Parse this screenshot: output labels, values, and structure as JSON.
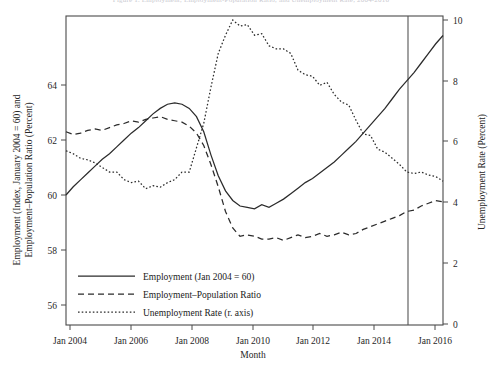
{
  "figure": {
    "cut_off_title": "Figure 1. Employment, Employment-Population Ratio, and Unemployment Rate, 2004-2016"
  },
  "axes": {
    "x_title": "Month",
    "y_left_title_line1": "Employment (Index, January 2004 = 60) and",
    "y_left_title_line2": "Employment–Population Ratio (Percent)",
    "y_right_title": "Unemployment Rate (Percent)",
    "x_ticks": [
      "Jan 2004",
      "Jan 2006",
      "Jan 2008",
      "Jan 2010",
      "Jan 2012",
      "Jan 2014",
      "Jan 2016"
    ],
    "y_left_ticks": [
      "56",
      "58",
      "60",
      "62",
      "64"
    ],
    "y_right_ticks": [
      "0",
      "2",
      "4",
      "6",
      "8",
      "10"
    ]
  },
  "legend": {
    "items": [
      {
        "label": "Employment (Jan 2004 = 60)",
        "style": "solid"
      },
      {
        "label": "Employment–Population Ratio",
        "style": "dashed"
      },
      {
        "label": "Unemployment Rate (r. axis)",
        "style": "dotted"
      }
    ]
  },
  "annotations": {
    "vertical_line_label": "Jan 2015"
  },
  "colors": {
    "line": "#2b2b2b",
    "frame": "#4a4a4a",
    "vline": "#555555",
    "background": "#ffffff"
  },
  "chart_data": {
    "type": "line",
    "title": "Employment, Employment-Population Ratio, and Unemployment Rate",
    "xlabel": "Month",
    "ylabel": "Employment (Index, January 2004 = 60) and Employment-Population Ratio (Percent)",
    "ylabel_right": "Unemployment Rate (Percent)",
    "ylim": [
      55.6,
      66.0
    ],
    "ylim_right": [
      0,
      10.5
    ],
    "xlim": [
      "Jan 2004",
      "Dec 2016"
    ],
    "grid": false,
    "legend_position": "lower left",
    "vertical_reference_line": "Jan 2015",
    "x": [
      "2004-01",
      "2004-04",
      "2004-07",
      "2004-10",
      "2005-01",
      "2005-04",
      "2005-07",
      "2005-10",
      "2006-01",
      "2006-04",
      "2006-07",
      "2006-10",
      "2007-01",
      "2007-04",
      "2007-07",
      "2007-10",
      "2008-01",
      "2008-04",
      "2008-07",
      "2008-10",
      "2009-01",
      "2009-04",
      "2009-07",
      "2009-10",
      "2010-01",
      "2010-04",
      "2010-07",
      "2010-10",
      "2011-01",
      "2011-04",
      "2011-07",
      "2011-10",
      "2012-01",
      "2012-04",
      "2012-07",
      "2012-10",
      "2013-01",
      "2013-04",
      "2013-07",
      "2013-10",
      "2014-01",
      "2014-04",
      "2014-07",
      "2014-10",
      "2015-01",
      "2015-04",
      "2015-07",
      "2015-10",
      "2016-01",
      "2016-04",
      "2016-07",
      "2016-10",
      "2016-12"
    ],
    "series": [
      {
        "name": "Employment (Jan 2004 = 60)",
        "style": "solid",
        "axis": "left",
        "units": "Index, January 2004 = 60",
        "values": [
          60.0,
          60.3,
          60.55,
          60.8,
          61.05,
          61.3,
          61.5,
          61.75,
          62.0,
          62.25,
          62.45,
          62.7,
          62.95,
          63.15,
          63.3,
          63.35,
          63.3,
          63.15,
          62.85,
          62.3,
          61.45,
          60.7,
          60.15,
          59.8,
          59.6,
          59.55,
          59.5,
          59.65,
          59.55,
          59.7,
          59.85,
          60.05,
          60.25,
          60.45,
          60.6,
          60.8,
          61.0,
          61.2,
          61.45,
          61.7,
          61.95,
          62.25,
          62.55,
          62.85,
          63.15,
          63.5,
          63.85,
          64.15,
          64.45,
          64.8,
          65.15,
          65.5,
          65.8
        ]
      },
      {
        "name": "Employment-Population Ratio",
        "style": "dashed",
        "axis": "left",
        "units": "Percent",
        "values": [
          62.3,
          62.2,
          62.25,
          62.35,
          62.4,
          62.35,
          62.45,
          62.55,
          62.6,
          62.7,
          62.65,
          62.75,
          62.8,
          62.85,
          62.75,
          62.7,
          62.65,
          62.5,
          62.25,
          61.8,
          61.1,
          60.3,
          59.4,
          58.8,
          58.5,
          58.55,
          58.5,
          58.4,
          58.4,
          58.45,
          58.35,
          58.45,
          58.55,
          58.45,
          58.5,
          58.6,
          58.5,
          58.55,
          58.65,
          58.55,
          58.6,
          58.75,
          58.85,
          58.95,
          59.05,
          59.15,
          59.25,
          59.4,
          59.45,
          59.6,
          59.7,
          59.8,
          59.75
        ]
      },
      {
        "name": "Unemployment Rate (r. axis)",
        "style": "dotted",
        "axis": "right",
        "units": "Percent",
        "values": [
          5.7,
          5.6,
          5.45,
          5.4,
          5.3,
          5.15,
          5.0,
          5.0,
          4.75,
          4.65,
          4.7,
          4.45,
          4.55,
          4.5,
          4.65,
          4.75,
          5.0,
          5.0,
          5.8,
          6.6,
          7.8,
          8.9,
          9.5,
          10.0,
          9.8,
          9.85,
          9.5,
          9.55,
          9.15,
          9.05,
          9.05,
          8.9,
          8.35,
          8.2,
          8.15,
          7.85,
          7.95,
          7.55,
          7.3,
          7.2,
          6.7,
          6.25,
          6.2,
          5.75,
          5.65,
          5.45,
          5.25,
          5.0,
          4.95,
          5.0,
          4.9,
          4.85,
          4.7
        ]
      }
    ]
  }
}
